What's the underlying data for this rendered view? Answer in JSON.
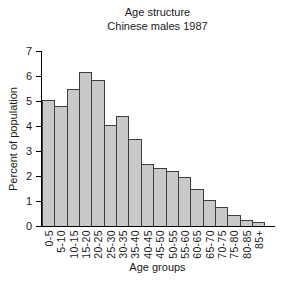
{
  "chart_data": {
    "type": "bar",
    "title": "Age structure",
    "subtitle": "Chinese males 1987",
    "xlabel": "Age groups",
    "ylabel": "Percent of population",
    "categories": [
      "0-5",
      "5-10",
      "10-15",
      "15-20",
      "20-25",
      "25-30",
      "30-35",
      "35-40",
      "40-45",
      "45-50",
      "50-55",
      "55-60",
      "60-65",
      "65-70",
      "70-75",
      "75-80",
      "80-85",
      "85+"
    ],
    "values": [
      5.0,
      4.75,
      5.45,
      6.1,
      5.8,
      4.0,
      4.35,
      3.45,
      2.45,
      2.3,
      2.15,
      1.9,
      1.45,
      1.0,
      0.7,
      0.4,
      0.2,
      0.1
    ],
    "ylim": [
      0,
      7
    ],
    "yticks": [
      0,
      1,
      2,
      3,
      4,
      5,
      6,
      7
    ],
    "grid": false,
    "legend": "none",
    "colors": {
      "bar_fill": "#c9c9c9",
      "bar_border": "#3d3d3d",
      "axis": "#000000",
      "text": "#1a1a1a",
      "background": "#ffffff"
    }
  }
}
